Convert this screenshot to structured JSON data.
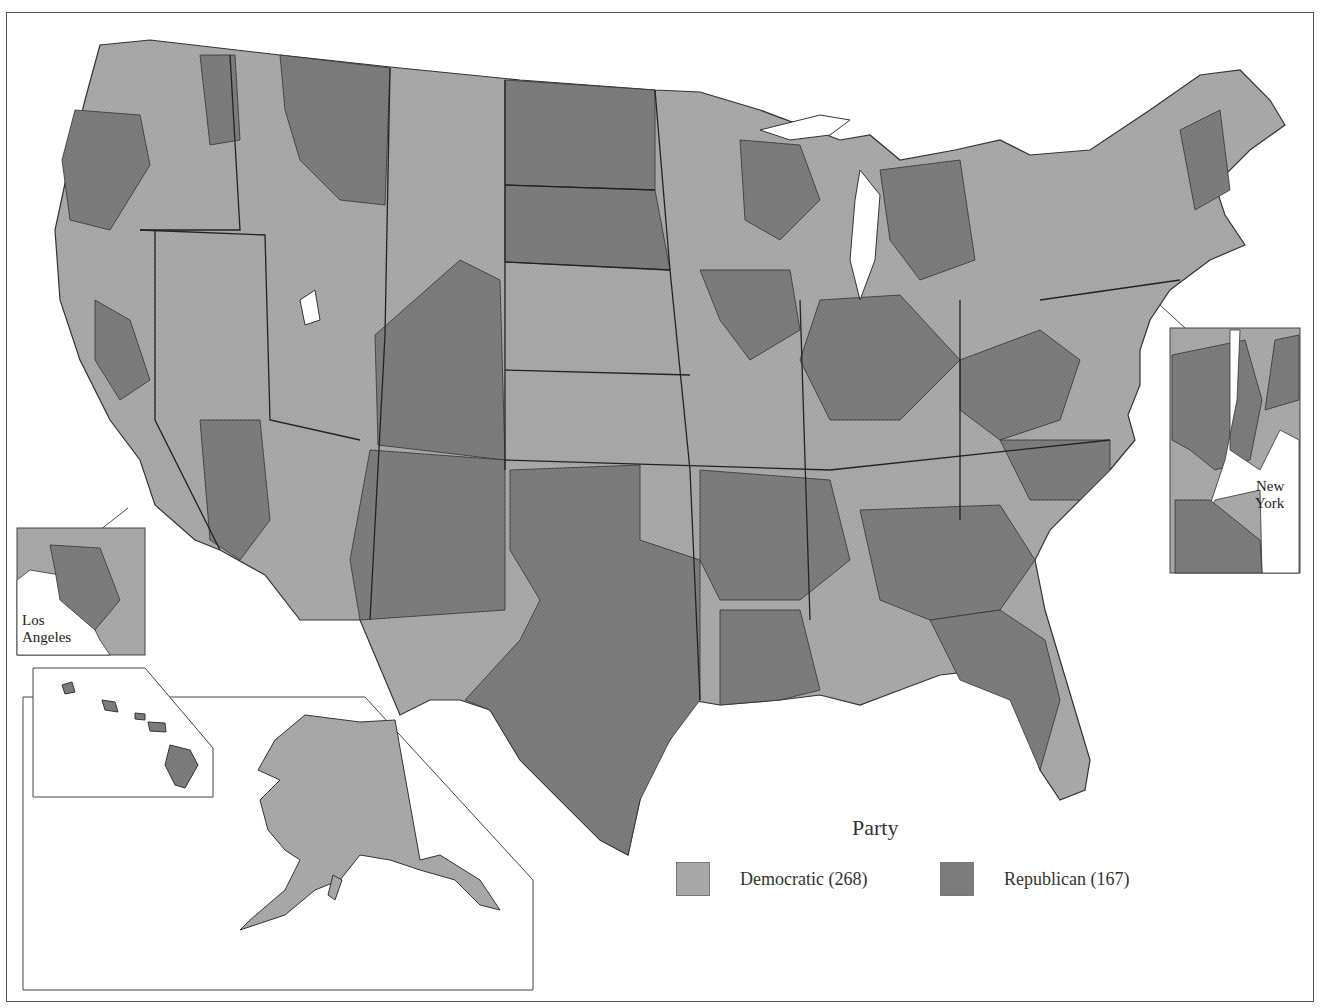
{
  "map": {
    "title": "",
    "insets": {
      "los_angeles": {
        "label_line1": "Los",
        "label_line2": "Angeles"
      },
      "new_york": {
        "label_line1": "New",
        "label_line2": "York"
      }
    }
  },
  "legend": {
    "title": "Party",
    "items": [
      {
        "label": "Democratic (268)",
        "color": "#a8a8a8"
      },
      {
        "label": "Republican (167)",
        "color": "#7c7c7c"
      }
    ]
  },
  "colors": {
    "democratic": "#a8a8a8",
    "republican": "#7c7c7c",
    "border": "#333333",
    "background": "#ffffff"
  }
}
